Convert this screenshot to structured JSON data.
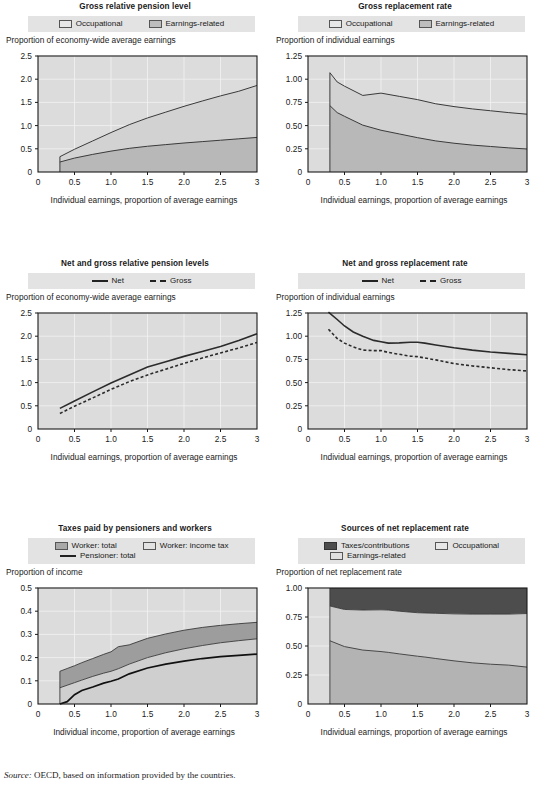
{
  "source_note": {
    "prefix": "Source:",
    "text": "OECD, based on information provided by the countries."
  },
  "common": {
    "xlabel_earnings": "Individual earnings, proportion of average earnings",
    "xlabel_income": "Individual income, proportion of average earnings",
    "xticks": [
      "0",
      "0.5",
      "1.0",
      "1.5",
      "2.0",
      "2.5",
      "3"
    ]
  },
  "chart_data": [
    {
      "id": "gross-relative-pension-level",
      "type": "area",
      "title": "Gross relative pension level",
      "ylabel": "Proportion of economy-wide average earnings",
      "xlabel": "Individual earnings, proportion of average earnings",
      "legend": [
        {
          "label": "Occupational",
          "color": "#e7e7e7"
        },
        {
          "label": "Earnings-related",
          "color": "#bdbdbd"
        }
      ],
      "legend_position": "top",
      "grid": true,
      "xlim": [
        0,
        3
      ],
      "ylim": [
        0,
        2.5
      ],
      "yticks": [
        "0",
        "0.5",
        "1.0",
        "1.5",
        "2.0",
        "2.5"
      ],
      "x": [
        0.3,
        0.5,
        0.75,
        1.0,
        1.25,
        1.5,
        1.75,
        2.0,
        2.25,
        2.5,
        2.75,
        3.0
      ],
      "series": [
        {
          "name": "Earnings-related",
          "values": [
            0.215,
            0.3,
            0.38,
            0.45,
            0.51,
            0.555,
            0.59,
            0.625,
            0.655,
            0.685,
            0.715,
            0.745
          ]
        },
        {
          "name": "Occupational",
          "values": [
            0.115,
            0.19,
            0.29,
            0.4,
            0.51,
            0.61,
            0.7,
            0.79,
            0.875,
            0.955,
            1.025,
            1.12
          ]
        }
      ],
      "stacked_top": [
        0.33,
        0.49,
        0.67,
        0.85,
        1.02,
        1.165,
        1.29,
        1.415,
        1.53,
        1.64,
        1.74,
        1.865
      ]
    },
    {
      "id": "gross-replacement-rate",
      "type": "area",
      "title": "Gross replacement rate",
      "ylabel": "Proportion of individual earnings",
      "xlabel": "Individual earnings, proportion of average earnings",
      "legend": [
        {
          "label": "Occupational",
          "color": "#e7e7e7"
        },
        {
          "label": "Earnings-related",
          "color": "#bdbdbd"
        }
      ],
      "legend_position": "top",
      "grid": true,
      "xlim": [
        0,
        3
      ],
      "ylim": [
        0,
        1.25
      ],
      "yticks": [
        "0",
        "0.25",
        "0.50",
        "0.75",
        "1.00",
        "1.25"
      ],
      "x": [
        0.3,
        0.4,
        0.5,
        0.75,
        1.0,
        1.25,
        1.5,
        1.75,
        2.0,
        2.25,
        2.5,
        2.75,
        3.0
      ],
      "series": [
        {
          "name": "Earnings-related",
          "values": [
            0.715,
            0.64,
            0.6,
            0.505,
            0.45,
            0.41,
            0.37,
            0.335,
            0.31,
            0.29,
            0.275,
            0.26,
            0.248
          ]
        },
        {
          "name": "Occupational",
          "values": [
            0.355,
            0.33,
            0.325,
            0.32,
            0.4,
            0.405,
            0.41,
            0.4,
            0.395,
            0.39,
            0.385,
            0.38,
            0.375
          ]
        }
      ],
      "stacked_top": [
        1.07,
        0.97,
        0.925,
        0.825,
        0.85,
        0.815,
        0.78,
        0.735,
        0.705,
        0.68,
        0.66,
        0.64,
        0.623
      ]
    },
    {
      "id": "net-and-gross-relative-pension-levels",
      "type": "line",
      "title": "Net and gross relative pension levels",
      "ylabel": "Proportion of economy-wide average earnings",
      "xlabel": "Individual earnings, proportion of average earnings",
      "legend": [
        {
          "label": "Net",
          "style": "solid"
        },
        {
          "label": "Gross",
          "style": "dashed"
        }
      ],
      "legend_position": "top",
      "grid": true,
      "xlim": [
        0,
        3
      ],
      "ylim": [
        0,
        2.5
      ],
      "yticks": [
        "0",
        "0.5",
        "1.0",
        "1.5",
        "2.0",
        "2.5"
      ],
      "x": [
        0.3,
        0.5,
        0.75,
        1.0,
        1.25,
        1.5,
        1.75,
        2.0,
        2.25,
        2.5,
        2.75,
        3.0
      ],
      "series": [
        {
          "name": "Net",
          "values": [
            0.445,
            0.605,
            0.8,
            0.99,
            1.165,
            1.335,
            1.45,
            1.565,
            1.67,
            1.78,
            1.905,
            2.055
          ]
        },
        {
          "name": "Gross",
          "values": [
            0.335,
            0.49,
            0.67,
            0.855,
            1.02,
            1.165,
            1.29,
            1.415,
            1.53,
            1.64,
            1.745,
            1.865
          ]
        }
      ]
    },
    {
      "id": "net-and-gross-replacement-rate",
      "type": "line",
      "title": "Net and gross replacement rate",
      "ylabel": "Proportion of individual earnings",
      "xlabel": "Individual earnings, proportion of average earnings",
      "legend": [
        {
          "label": "Net",
          "style": "solid"
        },
        {
          "label": "Gross",
          "style": "dashed"
        }
      ],
      "legend_position": "top",
      "grid": true,
      "xlim": [
        0,
        3
      ],
      "ylim": [
        0,
        1.25
      ],
      "yticks": [
        "0",
        "0.25",
        "0.50",
        "0.75",
        "1.00",
        "1.25"
      ],
      "x": [
        0.28,
        0.4,
        0.5,
        0.62,
        0.75,
        0.9,
        1.0,
        1.1,
        1.25,
        1.4,
        1.5,
        1.6,
        1.75,
        2.0,
        2.25,
        2.5,
        2.75,
        3.0
      ],
      "series": [
        {
          "name": "Net",
          "values": [
            1.26,
            1.18,
            1.11,
            1.045,
            1.0,
            0.955,
            0.94,
            0.925,
            0.928,
            0.935,
            0.935,
            0.925,
            0.905,
            0.875,
            0.85,
            0.83,
            0.815,
            0.8
          ]
        },
        {
          "name": "Gross",
          "values": [
            1.075,
            0.975,
            0.925,
            0.885,
            0.85,
            0.845,
            0.845,
            0.825,
            0.805,
            0.785,
            0.78,
            0.765,
            0.745,
            0.705,
            0.68,
            0.66,
            0.64,
            0.625
          ]
        }
      ]
    },
    {
      "id": "taxes-paid-by-pensioners-and-workers",
      "type": "area",
      "title": "Taxes paid by pensioners and workers",
      "ylabel": "Proportion of income",
      "xlabel": "Individual income, proportion of average earnings",
      "legend": [
        {
          "label": "Worker: total",
          "color": "#a8a8a8"
        },
        {
          "label": "Worker: income tax",
          "color": "#e2e2e2"
        },
        {
          "label": "Pensioner: total",
          "style": "solid"
        }
      ],
      "legend_position": "top",
      "grid": true,
      "xlim": [
        0,
        3
      ],
      "ylim": [
        0,
        0.5
      ],
      "yticks": [
        "0",
        "0.1",
        "0.2",
        "0.3",
        "0.4",
        "0.5"
      ],
      "x": [
        0.3,
        0.4,
        0.5,
        0.6,
        0.75,
        0.9,
        1.0,
        1.1,
        1.25,
        1.5,
        1.75,
        2.0,
        2.25,
        2.5,
        2.75,
        3.0
      ],
      "series": [
        {
          "name": "Worker: income tax",
          "values": [
            0.07,
            0.081,
            0.092,
            0.103,
            0.119,
            0.133,
            0.141,
            0.152,
            0.172,
            0.2,
            0.221,
            0.238,
            0.252,
            0.264,
            0.273,
            0.281
          ]
        },
        {
          "name": "Worker: total",
          "values": [
            0.141,
            0.153,
            0.165,
            0.178,
            0.196,
            0.214,
            0.225,
            0.247,
            0.255,
            0.283,
            0.302,
            0.318,
            0.33,
            0.339,
            0.346,
            0.352
          ]
        },
        {
          "name": "Pensioner: total",
          "values": [
            0.0,
            0.01,
            0.04,
            0.058,
            0.073,
            0.09,
            0.098,
            0.108,
            0.13,
            0.155,
            0.172,
            0.185,
            0.196,
            0.204,
            0.21,
            0.215
          ]
        }
      ]
    },
    {
      "id": "sources-of-net-replacement-rate",
      "type": "area",
      "title": "Sources of net replacement rate",
      "ylabel": "Proportion of net replacement rate",
      "xlabel": "Individual earnings, proportion of average earnings",
      "legend": [
        {
          "label": "Taxes/contributions",
          "color": "#4d4d4d"
        },
        {
          "label": "Occupational",
          "color": "#c9c9c9"
        },
        {
          "label": "Earnings-related",
          "color": "#b3b3b3"
        }
      ],
      "legend_position": "top",
      "grid": true,
      "xlim": [
        0,
        3
      ],
      "ylim": [
        0,
        1.0
      ],
      "yticks": [
        "0",
        "0.25",
        "0.50",
        "0.75",
        "1.00"
      ],
      "x": [
        0.3,
        0.5,
        0.75,
        1.0,
        1.1,
        1.25,
        1.5,
        1.6,
        1.75,
        2.0,
        2.25,
        2.5,
        2.75,
        3.0
      ],
      "series": [
        {
          "name": "Earnings-related",
          "values": [
            0.545,
            0.495,
            0.465,
            0.452,
            0.445,
            0.432,
            0.412,
            0.405,
            0.392,
            0.372,
            0.355,
            0.343,
            0.335,
            0.318
          ]
        },
        {
          "name": "Occupational",
          "values": [
            0.3,
            0.32,
            0.345,
            0.36,
            0.365,
            0.368,
            0.375,
            0.38,
            0.39,
            0.405,
            0.42,
            0.432,
            0.44,
            0.462
          ]
        },
        {
          "name": "Taxes/contributions",
          "values": [
            0.155,
            0.185,
            0.19,
            0.188,
            0.19,
            0.2,
            0.213,
            0.215,
            0.218,
            0.223,
            0.225,
            0.225,
            0.225,
            0.22
          ]
        }
      ],
      "stacked_bounds": {
        "lower": [
          0.545,
          0.495,
          0.465,
          0.452,
          0.445,
          0.432,
          0.412,
          0.405,
          0.392,
          0.372,
          0.355,
          0.343,
          0.335,
          0.318
        ],
        "upper": [
          0.845,
          0.815,
          0.81,
          0.812,
          0.81,
          0.8,
          0.787,
          0.785,
          0.782,
          0.777,
          0.775,
          0.775,
          0.775,
          0.78
        ]
      }
    }
  ]
}
